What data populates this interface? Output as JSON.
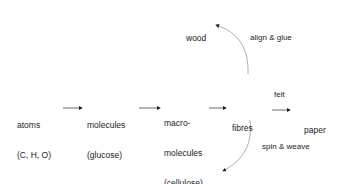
{
  "diagram": {
    "type": "flow",
    "nodes": [
      {
        "id": "atoms",
        "line1": "atoms",
        "line2": "(C, H, O)"
      },
      {
        "id": "molecules",
        "line1": "molecules",
        "line2": "(glucose)"
      },
      {
        "id": "macromolecules",
        "line1": "macro-",
        "line2": "molecules",
        "line3": "(cellulose)"
      },
      {
        "id": "fibres",
        "line1": "fibres"
      },
      {
        "id": "paper",
        "line1": "paper"
      },
      {
        "id": "wood",
        "line1": "wood"
      },
      {
        "id": "fabric",
        "line1": "fabric"
      }
    ],
    "edges": [
      {
        "from": "atoms",
        "to": "molecules",
        "label": ""
      },
      {
        "from": "molecules",
        "to": "macromolecules",
        "label": ""
      },
      {
        "from": "macromolecules",
        "to": "fibres",
        "label": ""
      },
      {
        "from": "fibres",
        "to": "paper",
        "label": "felt"
      },
      {
        "from": "fibres",
        "to": "wood",
        "label": "align & glue"
      },
      {
        "from": "fibres",
        "to": "fabric",
        "label": "spin & weave"
      }
    ],
    "colors": {
      "text": "#222222",
      "arrow": "#333333",
      "curve": "#999999"
    }
  }
}
